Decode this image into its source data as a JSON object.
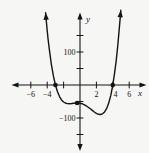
{
  "figure": {
    "bg": "#f6f6f4",
    "ink": "#141414"
  },
  "axes": {
    "x_label": "x",
    "y_label": "y",
    "x_ticks": [
      -6,
      -4,
      -2,
      2,
      4,
      6
    ],
    "x_tick_labels": [
      {
        "value": -6,
        "text": "−6",
        "dx": 0
      },
      {
        "value": -4,
        "text": "−4",
        "dx": 0
      },
      {
        "value": 2,
        "text": "2",
        "dx": 0
      },
      {
        "value": 4,
        "text": "4",
        "dx": 2.7
      },
      {
        "value": 6,
        "text": "6",
        "dx": 0
      }
    ],
    "y_ticks": [
      -150,
      -100,
      -50,
      50,
      100,
      150
    ],
    "y_tick_labels": [
      {
        "value": 100,
        "text": "100",
        "x": 75.5,
        "y": 54.8
      },
      {
        "value": -100,
        "text": "−100",
        "x": 75.5,
        "y": 120.8
      }
    ]
  },
  "chart_data": {
    "type": "line",
    "title": "",
    "xlabel": "x",
    "ylabel": "y",
    "xlim": [
      -8.2,
      8.2
    ],
    "ylim": [
      -200,
      230
    ],
    "x_tick_step": 2,
    "y_tick_step": 50,
    "labeled_x_ticks": [
      -6,
      -4,
      2,
      4,
      6
    ],
    "labeled_y_ticks": [
      100,
      -100
    ],
    "grid": false,
    "legend": false,
    "axis_arrows": true,
    "curve_end_arrows": true,
    "curve": {
      "description": "quartic-like polynomial, both ends rising with up arrowheads; x-intercepts at -3 and 4; flat local max near (-0.4, -55); local min near (2.5, -90)",
      "points": [
        [
          -4.2,
          218.84
        ],
        [
          -4.1,
          190.76
        ],
        [
          -4.0,
          164.8
        ],
        [
          -3.9,
          140.85
        ],
        [
          -3.75,
          108.5
        ],
        [
          -3.5,
          63.19
        ],
        [
          -3.25,
          27.48
        ],
        [
          -3.0,
          0.0
        ],
        [
          -2.75,
          -20.52
        ],
        [
          -2.5,
          -35.26
        ],
        [
          -2.25,
          -45.28
        ],
        [
          -2.0,
          -51.6
        ],
        [
          -1.75,
          -55.06
        ],
        [
          -1.5,
          -56.51
        ],
        [
          -1.25,
          -56.6
        ],
        [
          -1.0,
          -56.0
        ],
        [
          -0.75,
          -55.15
        ],
        [
          -0.5,
          -54.56
        ],
        [
          -0.35,
          -54.4
        ],
        [
          -0.25,
          -54.46
        ],
        [
          0.0,
          -55.2
        ],
        [
          0.25,
          -56.79
        ],
        [
          0.5,
          -59.41
        ],
        [
          0.75,
          -62.89
        ],
        [
          1.0,
          -67.2
        ],
        [
          1.25,
          -71.99
        ],
        [
          1.5,
          -77.06
        ],
        [
          1.75,
          -81.87
        ],
        [
          2.0,
          -86.0
        ],
        [
          2.25,
          -88.75
        ],
        [
          2.5,
          -89.51
        ],
        [
          2.75,
          -87.4
        ],
        [
          3.0,
          -81.6
        ],
        [
          3.25,
          -71.06
        ],
        [
          3.5,
          -54.76
        ],
        [
          3.75,
          -31.49
        ],
        [
          4.0,
          0.0
        ],
        [
          4.2,
          32.03
        ],
        [
          4.4,
          70.92
        ],
        [
          4.6,
          117.47
        ],
        [
          4.75,
          157.87
        ],
        [
          4.9,
          203.4
        ],
        [
          4.97,
          226.5
        ]
      ]
    },
    "marked_points": [
      {
        "x": -3.0,
        "y": 0,
        "note": "left x-intercept dot"
      },
      {
        "x": -0.35,
        "y": -54.4,
        "note": "solid dot at flat local max beside y-axis"
      },
      {
        "x": 4.0,
        "y": 0,
        "note": "right x-intercept dot"
      }
    ],
    "x_intercepts": [
      -3,
      4
    ],
    "local_min": [
      2.5,
      -90
    ],
    "local_max": [
      -0.35,
      -55
    ]
  },
  "layout": {
    "x0": 80,
    "y0": 85,
    "sx": 8.2,
    "sy": 0.33,
    "x_axis_span": [
      15,
      143.5
    ],
    "y_axis_span": [
      16,
      148
    ],
    "x_arrow_tips": [
      [
        11.5,
        85
      ],
      [
        146.5,
        85
      ]
    ],
    "y_arrow_tips": [
      [
        80,
        12.5
      ],
      [
        80,
        151
      ]
    ],
    "tick_half": 3.4,
    "dot_radius": 2.3,
    "curve_stroke": 1.4
  }
}
